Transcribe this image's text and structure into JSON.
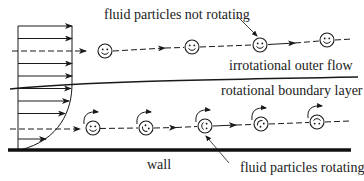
{
  "diagram": {
    "type": "boundary-layer-vorticity",
    "labels": {
      "top_annotation": "fluid particles not rotating",
      "outer_region": "irrotational outer flow",
      "inner_region": "rotational boundary layer",
      "wall": "wall",
      "bottom_annotation": "fluid particles rotating"
    },
    "colors": {
      "ink": "#1a1a1a",
      "background": "#ffffff"
    },
    "outer_particles": [
      {
        "x": 105,
        "y": 51,
        "rotating": false
      },
      {
        "x": 192,
        "y": 47,
        "rotating": false
      },
      {
        "x": 260,
        "y": 45,
        "rotating": false
      },
      {
        "x": 327,
        "y": 40,
        "rotating": false
      }
    ],
    "inner_particles": [
      {
        "x": 93,
        "y": 128,
        "rotating": true,
        "rotation_deg": 0
      },
      {
        "x": 146,
        "y": 128,
        "rotating": true,
        "rotation_deg": 45
      },
      {
        "x": 205,
        "y": 126,
        "rotating": true,
        "rotation_deg": 90
      },
      {
        "x": 261,
        "y": 124,
        "rotating": true,
        "rotation_deg": 135
      },
      {
        "x": 317,
        "y": 122,
        "rotating": true,
        "rotation_deg": 180
      }
    ]
  }
}
